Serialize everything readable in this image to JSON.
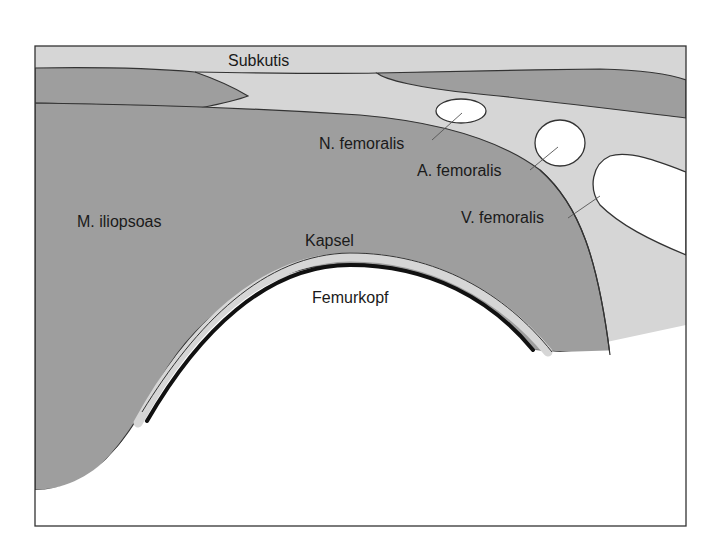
{
  "diagram": {
    "type": "anatomical cross-section",
    "colors": {
      "background": "#ffffff",
      "subcutis": "#d6d6d6",
      "muscle": "#9e9e9e",
      "vessel_nerve": "#ffffff",
      "bone": "#ffffff",
      "capsule": "#d6d6d6",
      "cartilage_line": "#111111",
      "outline": "#333333"
    },
    "labels": {
      "subkutis": "Subkutis",
      "n_femoralis": "N. femoralis",
      "a_femoralis": "A. femoralis",
      "v_femoralis": "V. femoralis",
      "m_iliopsoas": "M. iliopsoas",
      "kapsel": "Kapsel",
      "femurkopf": "Femurkopf"
    }
  }
}
